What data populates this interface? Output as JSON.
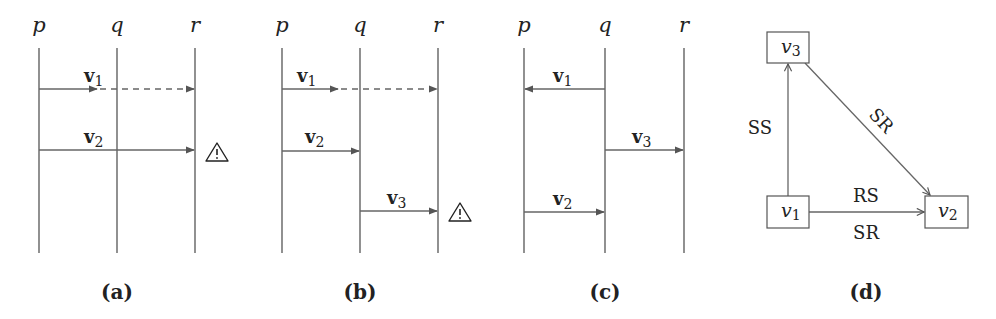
{
  "panels": {
    "a": {
      "caption": "(a)",
      "processes": [
        "p",
        "q",
        "r"
      ],
      "messages": [
        {
          "label": "v",
          "sub": "1",
          "from": "p",
          "to": "r",
          "style": "delivered-to-q-dashed-to-r"
        },
        {
          "label": "v",
          "sub": "2",
          "from": "p",
          "to": "r",
          "style": "solid",
          "warning": true
        }
      ]
    },
    "b": {
      "caption": "(b)",
      "processes": [
        "p",
        "q",
        "r"
      ],
      "messages": [
        {
          "label": "v",
          "sub": "1",
          "from": "p",
          "to": "r",
          "style": "delivered-to-q-dashed-to-r"
        },
        {
          "label": "v",
          "sub": "2",
          "from": "p",
          "to": "q",
          "style": "solid"
        },
        {
          "label": "v",
          "sub": "3",
          "from": "q",
          "to": "r",
          "style": "solid",
          "warning": true
        }
      ]
    },
    "c": {
      "caption": "(c)",
      "processes": [
        "p",
        "q",
        "r"
      ],
      "messages": [
        {
          "label": "v",
          "sub": "1",
          "from": "q",
          "to": "p",
          "style": "solid"
        },
        {
          "label": "v",
          "sub": "3",
          "from": "q",
          "to": "r",
          "style": "solid"
        },
        {
          "label": "v",
          "sub": "2",
          "from": "p",
          "to": "q",
          "style": "solid"
        }
      ]
    },
    "d": {
      "caption": "(d)",
      "nodes": [
        {
          "id": "v3",
          "label": "v",
          "sub": "3"
        },
        {
          "id": "v1",
          "label": "v",
          "sub": "1"
        },
        {
          "id": "v2",
          "label": "v",
          "sub": "2"
        }
      ],
      "edges": [
        {
          "from": "v1",
          "to": "v3",
          "label": "SS"
        },
        {
          "from": "v3",
          "to": "v2",
          "label": "SR"
        },
        {
          "from": "v1",
          "to": "v2",
          "label_above": "RS",
          "label_below": "SR"
        }
      ]
    }
  },
  "warning_icon": "⚠"
}
